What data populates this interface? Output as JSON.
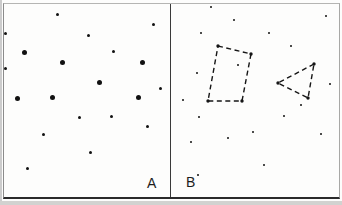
{
  "figure": {
    "dot_color": "#111111",
    "shape_color": "#161616",
    "border_color": "#8b8b8b",
    "divider_color": "#3a3a3a"
  },
  "panel_a": {
    "label": "A",
    "large_dot_size": 5,
    "small_dot_size": 3,
    "large_dots": [
      [
        24,
        52
      ],
      [
        62,
        62
      ],
      [
        142,
        62
      ],
      [
        99,
        82
      ],
      [
        17,
        98
      ],
      [
        52,
        97
      ],
      [
        138,
        97
      ]
    ],
    "small_dots": [
      [
        57,
        14
      ],
      [
        153,
        24
      ],
      [
        88,
        35
      ],
      [
        5,
        33
      ],
      [
        113,
        51
      ],
      [
        5,
        68
      ],
      [
        160,
        88
      ],
      [
        79,
        117
      ],
      [
        111,
        116
      ],
      [
        147,
        126
      ],
      [
        43,
        134
      ],
      [
        90,
        152
      ],
      [
        27,
        168
      ]
    ]
  },
  "panel_b": {
    "label": "B",
    "dot_size": 2,
    "small_dots": [
      [
        211,
        7
      ],
      [
        234,
        20
      ],
      [
        326,
        16
      ],
      [
        201,
        33
      ],
      [
        269,
        33
      ],
      [
        291,
        46
      ],
      [
        238,
        65
      ],
      [
        197,
        73
      ],
      [
        330,
        84
      ],
      [
        183,
        100
      ],
      [
        301,
        105
      ],
      [
        199,
        117
      ],
      [
        284,
        116
      ],
      [
        321,
        134
      ],
      [
        253,
        132
      ],
      [
        228,
        138
      ],
      [
        191,
        142
      ],
      [
        264,
        165
      ],
      [
        198,
        175
      ]
    ],
    "shapes": {
      "quadrilateral": {
        "points": [
          [
            218,
            46
          ],
          [
            251,
            54
          ],
          [
            242,
            101
          ],
          [
            208,
            101
          ]
        ]
      },
      "triangle": {
        "points": [
          [
            314,
            64
          ],
          [
            278,
            83
          ],
          [
            308,
            98
          ]
        ]
      }
    }
  }
}
